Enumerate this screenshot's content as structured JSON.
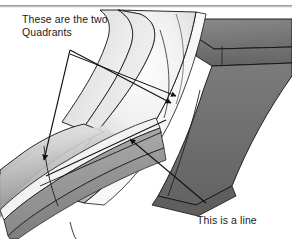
{
  "figure": {
    "page_rule": {
      "present": true,
      "color": "#8d8d8d"
    },
    "background_color": "#ffffff",
    "annotations": [
      {
        "id": "quadrants",
        "text": "These are the two\nQuadrants",
        "leader_apex": [
          70,
          50
        ],
        "arrow_targets": [
          [
            42,
            163
          ],
          [
            174,
            106
          ]
        ],
        "color": "#1a1a1a"
      },
      {
        "id": "line",
        "text": "This is a line",
        "leader_apex": [
          206,
          203
        ],
        "arrow_targets": [
          [
            127,
            137
          ]
        ],
        "color": "#1a1a1a"
      }
    ],
    "palette": {
      "outline": "#111111",
      "dark_face": "#6f6f6f",
      "mid_face": "#9a9a9a",
      "light_face": "#d8d8d8",
      "highlight": "#f5f5f5",
      "white_band": "#fbfbfb",
      "shadow": "#555555"
    }
  }
}
